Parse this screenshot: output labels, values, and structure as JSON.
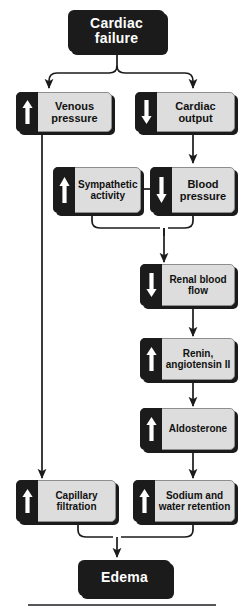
{
  "diagram": {
    "colors": {
      "terminal_fill": "#1b1b1b",
      "terminal_text": "#ffffff",
      "node_fill": "#dddddd",
      "node_border": "#8e8e8e",
      "node_text": "#111111",
      "tab_fill": "#1b1b1b",
      "arrow_glyph": "#ffffff",
      "connector": "#1b1b1b",
      "background": "#ffffff",
      "rule": "#55565a"
    },
    "nodes": {
      "cardiac_failure": {
        "label": "Cardiac failure",
        "line1": "Cardiac",
        "line2": "failure",
        "type": "terminal"
      },
      "venous_pressure": {
        "label": "Venous pressure",
        "line1": "Venous",
        "line2": "pressure",
        "direction": "up",
        "icon": "up-arrow-icon"
      },
      "cardiac_output": {
        "label": "Cardiac output",
        "line1": "Cardiac",
        "line2": "output",
        "direction": "down",
        "icon": "down-arrow-icon"
      },
      "sympathetic_activity": {
        "label": "Sympathetic activity",
        "line1": "Sympathetic",
        "line2": "activity",
        "direction": "up",
        "icon": "up-arrow-icon"
      },
      "blood_pressure": {
        "label": "Blood pressure",
        "line1": "Blood",
        "line2": "pressure",
        "direction": "down",
        "icon": "down-arrow-icon"
      },
      "renal_blood_flow": {
        "label": "Renal blood flow",
        "line1": "Renal blood",
        "line2": "flow",
        "direction": "down",
        "icon": "down-arrow-icon"
      },
      "renin_angiotensin": {
        "label": "Renin, angiotensin II",
        "line1": "Renin,",
        "line2": "angiotensin II",
        "direction": "up",
        "icon": "up-arrow-icon"
      },
      "aldosterone": {
        "label": "Aldosterone",
        "line1": "Aldosterone",
        "line2": "",
        "direction": "up",
        "icon": "up-arrow-icon"
      },
      "capillary_filtration": {
        "label": "Capillary filtration",
        "line1": "Capillary",
        "line2": "filtration",
        "direction": "up",
        "icon": "up-arrow-icon"
      },
      "sodium_water_retention": {
        "label": "Sodium and water retention",
        "line1": "Sodium and",
        "line2": "water retention",
        "direction": "up",
        "icon": "up-arrow-icon"
      },
      "edema": {
        "label": "Edema",
        "line1": "Edema",
        "line2": "",
        "type": "terminal"
      }
    },
    "edges": [
      {
        "from": "cardiac_failure",
        "to": "venous_pressure",
        "style": "fork-left"
      },
      {
        "from": "cardiac_failure",
        "to": "cardiac_output",
        "style": "fork-right"
      },
      {
        "from": "venous_pressure",
        "to": "capillary_filtration",
        "style": "long-vertical-left"
      },
      {
        "from": "cardiac_output",
        "to": "blood_pressure",
        "style": "vertical"
      },
      {
        "from": "blood_pressure",
        "to": "sympathetic_activity",
        "style": "horizontal-left"
      },
      {
        "from": "sympathetic_activity",
        "to": "renal_blood_flow",
        "style": "merge"
      },
      {
        "from": "blood_pressure",
        "to": "renal_blood_flow",
        "style": "merge"
      },
      {
        "from": "renal_blood_flow",
        "to": "renin_angiotensin",
        "style": "vertical"
      },
      {
        "from": "renin_angiotensin",
        "to": "aldosterone",
        "style": "vertical"
      },
      {
        "from": "aldosterone",
        "to": "sodium_water_retention",
        "style": "vertical"
      },
      {
        "from": "capillary_filtration",
        "to": "edema",
        "style": "merge"
      },
      {
        "from": "sodium_water_retention",
        "to": "edema",
        "style": "merge"
      }
    ]
  }
}
